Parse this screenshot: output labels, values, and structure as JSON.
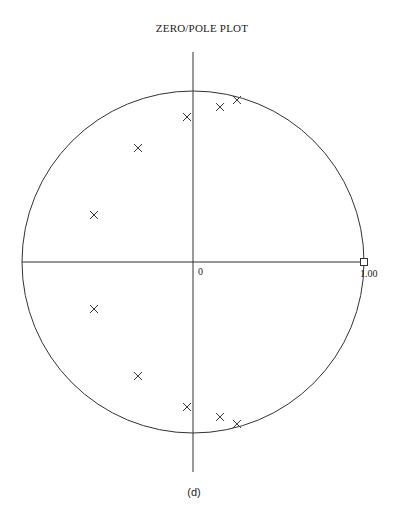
{
  "title": "ZERO/POLE PLOT",
  "caption": "(d)",
  "chart_data": {
    "type": "scatter",
    "title": "ZERO/POLE PLOT",
    "xlabel": "",
    "ylabel": "",
    "unit_circle": true,
    "axis_labels": {
      "origin": "0",
      "real_max": "1.00"
    },
    "xlim": [
      -1,
      1
    ],
    "ylim": [
      -1,
      1
    ],
    "grid": false,
    "series": [
      {
        "name": "zeros",
        "marker": "x",
        "points": [
          [
            0.257,
            0.947
          ],
          [
            0.158,
            0.906
          ],
          [
            -0.035,
            0.848
          ],
          [
            -0.322,
            0.667
          ],
          [
            -0.579,
            0.275
          ],
          [
            0.257,
            -0.947
          ],
          [
            0.158,
            -0.906
          ],
          [
            -0.035,
            -0.848
          ],
          [
            -0.322,
            -0.667
          ],
          [
            -0.579,
            -0.275
          ]
        ]
      },
      {
        "name": "poles",
        "marker": "square",
        "points": [
          [
            1.0,
            0.0
          ]
        ]
      }
    ]
  }
}
